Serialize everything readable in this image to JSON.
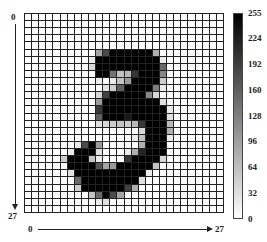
{
  "chart_data": {
    "type": "heatmap",
    "title": "",
    "xlabel": "",
    "ylabel": "",
    "x_axis": {
      "start": "0",
      "end": "27",
      "direction": "left-to-right"
    },
    "y_axis": {
      "start": "0",
      "end": "27",
      "direction": "top-to-bottom"
    },
    "colorbar": {
      "min": 0,
      "max": 255,
      "ticks": [
        255,
        224,
        192,
        160,
        128,
        96,
        64,
        32,
        0
      ],
      "cmap": "gray_r"
    },
    "grid": true,
    "rows": 28,
    "cols": 28,
    "values": [
      [
        0,
        0,
        0,
        0,
        0,
        0,
        0,
        0,
        0,
        0,
        0,
        0,
        0,
        0,
        0,
        0,
        0,
        0,
        0,
        0,
        0,
        0,
        0,
        0,
        0,
        0,
        0,
        0
      ],
      [
        0,
        0,
        0,
        0,
        0,
        0,
        0,
        0,
        0,
        0,
        0,
        0,
        0,
        0,
        0,
        0,
        0,
        0,
        0,
        0,
        0,
        0,
        0,
        0,
        0,
        0,
        0,
        0
      ],
      [
        0,
        0,
        0,
        0,
        0,
        0,
        0,
        0,
        0,
        0,
        0,
        0,
        0,
        0,
        0,
        0,
        0,
        0,
        0,
        0,
        0,
        0,
        0,
        0,
        0,
        0,
        0,
        0
      ],
      [
        0,
        0,
        0,
        0,
        0,
        0,
        0,
        0,
        0,
        0,
        0,
        0,
        0,
        0,
        0,
        0,
        0,
        0,
        0,
        0,
        0,
        0,
        0,
        0,
        0,
        0,
        0,
        0
      ],
      [
        0,
        0,
        0,
        0,
        0,
        0,
        0,
        0,
        0,
        0,
        0,
        0,
        0,
        0,
        0,
        0,
        0,
        0,
        0,
        0,
        0,
        0,
        0,
        0,
        0,
        0,
        0,
        0
      ],
      [
        0,
        0,
        0,
        0,
        0,
        0,
        0,
        0,
        0,
        0,
        90,
        180,
        255,
        255,
        255,
        255,
        255,
        255,
        80,
        0,
        0,
        0,
        0,
        0,
        0,
        0,
        0,
        0
      ],
      [
        0,
        0,
        0,
        0,
        0,
        0,
        0,
        0,
        0,
        20,
        255,
        255,
        255,
        255,
        255,
        255,
        255,
        255,
        255,
        20,
        0,
        0,
        0,
        0,
        0,
        0,
        0,
        0
      ],
      [
        0,
        0,
        0,
        0,
        0,
        0,
        0,
        0,
        0,
        40,
        255,
        255,
        255,
        255,
        255,
        255,
        255,
        255,
        255,
        150,
        0,
        0,
        0,
        0,
        0,
        0,
        0,
        0
      ],
      [
        0,
        0,
        0,
        0,
        0,
        0,
        0,
        0,
        0,
        0,
        255,
        255,
        140,
        60,
        70,
        200,
        255,
        255,
        255,
        120,
        0,
        0,
        0,
        0,
        0,
        0,
        0,
        0
      ],
      [
        0,
        0,
        0,
        0,
        0,
        0,
        0,
        0,
        0,
        0,
        20,
        0,
        20,
        60,
        100,
        255,
        255,
        255,
        255,
        50,
        0,
        0,
        0,
        0,
        0,
        0,
        0,
        0
      ],
      [
        0,
        0,
        0,
        0,
        0,
        0,
        0,
        0,
        0,
        0,
        0,
        30,
        50,
        160,
        255,
        255,
        255,
        255,
        130,
        20,
        0,
        0,
        0,
        0,
        0,
        0,
        0,
        0
      ],
      [
        0,
        0,
        0,
        0,
        0,
        0,
        0,
        0,
        0,
        0,
        40,
        190,
        255,
        255,
        255,
        255,
        255,
        120,
        40,
        0,
        0,
        0,
        0,
        0,
        0,
        0,
        0,
        0
      ],
      [
        0,
        0,
        0,
        0,
        0,
        0,
        0,
        0,
        0,
        0,
        100,
        255,
        255,
        255,
        255,
        255,
        255,
        255,
        255,
        30,
        0,
        0,
        0,
        0,
        0,
        0,
        0,
        0
      ],
      [
        0,
        0,
        0,
        0,
        0,
        0,
        0,
        0,
        0,
        0,
        200,
        255,
        255,
        255,
        255,
        255,
        255,
        255,
        255,
        255,
        20,
        0,
        0,
        0,
        0,
        0,
        0,
        0
      ],
      [
        0,
        0,
        0,
        0,
        0,
        0,
        0,
        0,
        0,
        0,
        160,
        255,
        255,
        255,
        230,
        255,
        255,
        255,
        255,
        255,
        30,
        0,
        0,
        0,
        0,
        0,
        0,
        0
      ],
      [
        0,
        0,
        0,
        0,
        0,
        0,
        0,
        0,
        0,
        0,
        30,
        40,
        50,
        60,
        50,
        70,
        200,
        255,
        255,
        255,
        70,
        0,
        0,
        0,
        0,
        0,
        0,
        0
      ],
      [
        0,
        0,
        0,
        0,
        0,
        0,
        0,
        0,
        0,
        0,
        0,
        0,
        0,
        0,
        0,
        0,
        40,
        255,
        255,
        255,
        80,
        0,
        0,
        0,
        0,
        0,
        0,
        0
      ],
      [
        0,
        0,
        0,
        0,
        0,
        0,
        0,
        0,
        0,
        0,
        0,
        0,
        0,
        0,
        0,
        20,
        60,
        255,
        255,
        255,
        20,
        0,
        0,
        0,
        0,
        0,
        0,
        0
      ],
      [
        0,
        0,
        0,
        0,
        0,
        0,
        0,
        20,
        180,
        255,
        100,
        0,
        0,
        0,
        0,
        0,
        80,
        255,
        255,
        255,
        0,
        0,
        0,
        0,
        0,
        0,
        0,
        0
      ],
      [
        0,
        0,
        0,
        0,
        0,
        0,
        20,
        255,
        255,
        255,
        30,
        0,
        0,
        0,
        20,
        80,
        220,
        255,
        255,
        255,
        0,
        0,
        0,
        0,
        0,
        0,
        0,
        0
      ],
      [
        0,
        0,
        0,
        0,
        0,
        50,
        255,
        255,
        255,
        60,
        20,
        0,
        0,
        0,
        200,
        255,
        255,
        255,
        255,
        40,
        0,
        0,
        0,
        0,
        0,
        0,
        0,
        0
      ],
      [
        0,
        0,
        0,
        0,
        0,
        0,
        255,
        255,
        255,
        255,
        170,
        90,
        100,
        255,
        255,
        255,
        255,
        255,
        60,
        0,
        0,
        0,
        0,
        0,
        0,
        0,
        0,
        0
      ],
      [
        0,
        0,
        0,
        0,
        0,
        0,
        30,
        255,
        255,
        255,
        255,
        255,
        255,
        255,
        255,
        255,
        255,
        20,
        0,
        0,
        0,
        0,
        0,
        0,
        0,
        0,
        0,
        0
      ],
      [
        0,
        0,
        0,
        0,
        0,
        0,
        0,
        150,
        255,
        255,
        255,
        255,
        255,
        255,
        255,
        255,
        30,
        0,
        0,
        0,
        0,
        0,
        0,
        0,
        0,
        0,
        0,
        0
      ],
      [
        0,
        0,
        0,
        0,
        0,
        0,
        0,
        50,
        255,
        255,
        255,
        255,
        255,
        255,
        190,
        80,
        0,
        0,
        0,
        0,
        0,
        0,
        0,
        0,
        0,
        0,
        0,
        0
      ],
      [
        0,
        0,
        0,
        0,
        0,
        0,
        0,
        0,
        0,
        60,
        150,
        255,
        180,
        90,
        0,
        0,
        0,
        0,
        0,
        0,
        0,
        0,
        0,
        0,
        0,
        0,
        0,
        0
      ],
      [
        0,
        0,
        0,
        0,
        0,
        0,
        0,
        0,
        0,
        0,
        20,
        30,
        0,
        0,
        0,
        0,
        0,
        0,
        0,
        0,
        0,
        0,
        0,
        0,
        0,
        0,
        0,
        0
      ],
      [
        0,
        0,
        0,
        0,
        0,
        0,
        0,
        0,
        0,
        0,
        0,
        0,
        0,
        0,
        0,
        0,
        0,
        0,
        0,
        0,
        0,
        0,
        0,
        0,
        0,
        0,
        0,
        0
      ]
    ]
  },
  "axis": {
    "y_start": "0",
    "y_end": "27",
    "x_start": "0",
    "x_end": "27"
  },
  "colorbar_ticks": [
    "255",
    "224",
    "192",
    "160",
    "128",
    "96",
    "64",
    "32",
    "0"
  ]
}
